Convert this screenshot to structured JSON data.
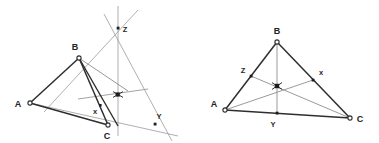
{
  "figure": {
    "background_color": "#ffffff",
    "width": 379,
    "height": 143,
    "stroke_dark": "#2e2e2e",
    "stroke_light": "#8e8e8e",
    "stroke_mid": "#6f6f6f",
    "vertex_fill": "#ffffff",
    "vertex_stroke": "#2e2e2e",
    "point_fill": "#1d1d1d"
  },
  "left_diagram": {
    "name": "projective-construction",
    "caption": "",
    "vertices": [
      {
        "label": "A",
        "x": 30,
        "y": 103,
        "label_x": 18,
        "label_y": 106,
        "marker": "open-circle"
      },
      {
        "label": "B",
        "x": 79,
        "y": 58,
        "label_x": 74,
        "label_y": 49,
        "marker": "open-circle"
      },
      {
        "label": "C",
        "x": 108,
        "y": 125,
        "label_x": 104,
        "label_y": 137,
        "marker": "open-circle"
      }
    ],
    "points": [
      {
        "label": "x",
        "x": 100,
        "y": 105,
        "label_x": 95,
        "label_y": 113,
        "marker": "filled-square"
      },
      {
        "label": "Z",
        "x": 118,
        "y": 28,
        "label_x": 123,
        "label_y": 32,
        "marker": "filled-square"
      },
      {
        "label": "Y",
        "x": 155,
        "y": 124,
        "label_x": 157,
        "label_y": 120,
        "marker": "filled-square"
      },
      {
        "label": "",
        "x": 118,
        "y": 94,
        "label_x": 0,
        "label_y": 0,
        "marker": "star"
      }
    ],
    "triangle_sides": [
      "A-B",
      "B-C",
      "A-C"
    ],
    "cevians": [
      "B-x-C-region",
      "A-through-intersection"
    ],
    "extended_lines": [
      "vertical-line-through-C-and-Z",
      "line-A-to-Y",
      "line-B-to-Z-extended",
      "line-through-intersection-horizontal"
    ]
  },
  "right_diagram": {
    "name": "median-centroid-construction",
    "caption": "",
    "vertices": [
      {
        "label": "A",
        "x": 225,
        "y": 110,
        "label_x": 213,
        "label_y": 106,
        "marker": "open-circle"
      },
      {
        "label": "B",
        "x": 277,
        "y": 42,
        "label_x": 272,
        "label_y": 33,
        "marker": "open-circle"
      },
      {
        "label": "C",
        "x": 350,
        "y": 118,
        "label_x": 356,
        "label_y": 120,
        "marker": "open-circle"
      }
    ],
    "points": [
      {
        "label": "Z",
        "x": 251,
        "y": 76,
        "label_x": 243,
        "label_y": 72,
        "marker": "filled-square"
      },
      {
        "label": "x",
        "x": 313,
        "y": 80,
        "label_x": 320,
        "label_y": 74,
        "marker": "filled-square"
      },
      {
        "label": "Y",
        "x": 277,
        "y": 113,
        "label_x": 272,
        "label_y": 126,
        "marker": "filled-square"
      },
      {
        "label": "",
        "x": 277,
        "y": 86,
        "label_x": 0,
        "label_y": 0,
        "marker": "star"
      }
    ],
    "medians": [
      "A-to-x",
      "B-to-Y",
      "C-to-Z"
    ],
    "triangle_sides": [
      "A-B",
      "B-C",
      "A-C"
    ]
  }
}
